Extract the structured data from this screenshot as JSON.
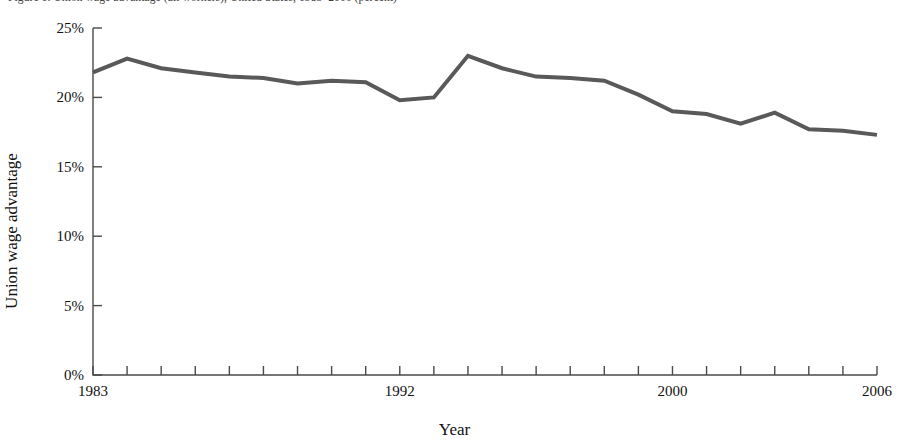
{
  "caption": {
    "text": "Figure 1. Union wage advantage (all workers), United States, 1983–2006 (percent)"
  },
  "chart_data": {
    "type": "line",
    "title": "",
    "xlabel": "Year",
    "ylabel": "Union wage advantage",
    "x": [
      1983,
      1984,
      1985,
      1986,
      1987,
      1988,
      1989,
      1990,
      1991,
      1992,
      1993,
      1994,
      1995,
      1996,
      1997,
      1998,
      1999,
      2000,
      2001,
      2002,
      2003,
      2004,
      2005,
      2006
    ],
    "values": [
      21.8,
      22.8,
      22.1,
      21.8,
      21.5,
      21.4,
      21.0,
      21.2,
      21.1,
      19.8,
      20.0,
      23.0,
      22.1,
      21.5,
      21.4,
      21.2,
      20.2,
      19.0,
      18.8,
      18.1,
      18.9,
      17.7,
      17.6,
      17.3
    ],
    "series": [
      {
        "name": "Union wage advantage",
        "values": [
          21.8,
          22.8,
          22.1,
          21.8,
          21.5,
          21.4,
          21.0,
          21.2,
          21.1,
          19.8,
          20.0,
          23.0,
          22.1,
          21.5,
          21.4,
          21.2,
          20.2,
          19.0,
          18.8,
          18.1,
          18.9,
          17.7,
          17.6,
          17.3
        ],
        "color": "#595959"
      }
    ],
    "xlim": [
      1983,
      2006
    ],
    "ylim": [
      0,
      25
    ],
    "ytick_values": [
      0,
      5,
      10,
      15,
      20,
      25
    ],
    "ytick_labels": [
      "0%",
      "5%",
      "10%",
      "15%",
      "20%",
      "25%"
    ],
    "xtick_values": [
      1983,
      1984,
      1985,
      1986,
      1987,
      1988,
      1989,
      1990,
      1991,
      1992,
      1993,
      1994,
      1995,
      1996,
      1997,
      1998,
      1999,
      2000,
      2001,
      2002,
      2003,
      2004,
      2005,
      2006
    ],
    "xtick_labeled": [
      {
        "value": 1983,
        "label": "1983"
      },
      {
        "value": 1992,
        "label": "1992"
      },
      {
        "value": 2000,
        "label": "2000"
      },
      {
        "value": 2006,
        "label": "2006"
      }
    ],
    "grid": false,
    "legend": "none",
    "axis_color": "#4a4a4a",
    "line_color": "#595959",
    "line_width": 4
  }
}
